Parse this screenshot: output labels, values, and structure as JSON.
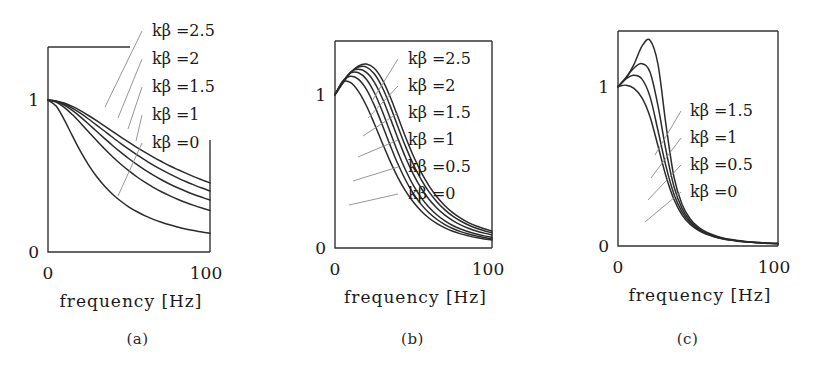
{
  "figure": {
    "axis_label": "frequency  [Hz]",
    "y_ticks": [
      "1",
      "0"
    ],
    "x_ticks": [
      "0",
      "100"
    ],
    "label_prefix": "kβ ="
  },
  "panels": [
    {
      "caption": "(a)",
      "labels": [
        "kβ =2.5",
        "kβ =2",
        "kβ =1.5",
        "kβ =1",
        "kβ =0"
      ]
    },
    {
      "caption": "(b)",
      "labels": [
        "kβ =2.5",
        "kβ =2",
        "kβ =1.5",
        "kβ =1",
        "kβ =0.5",
        "kβ =0"
      ]
    },
    {
      "caption": "(c)",
      "labels": [
        "kβ =1.5",
        "kβ =1",
        "kβ =0.5",
        "kβ =0"
      ]
    }
  ],
  "chart_data": [
    {
      "type": "line",
      "panel": "(a)",
      "title": "",
      "xlabel": "frequency  [Hz]",
      "ylabel": "",
      "xlim": [
        0,
        100
      ],
      "ylim": [
        0,
        1.35
      ],
      "xticks": [
        0,
        100
      ],
      "yticks": [
        0,
        1
      ],
      "grid": false,
      "legend": "inline-leader-lines",
      "x": [
        0,
        5,
        10,
        15,
        20,
        25,
        30,
        35,
        40,
        45,
        50,
        55,
        60,
        65,
        70,
        75,
        80,
        85,
        90,
        95,
        100
      ],
      "series": [
        {
          "name": "kβ =2.5",
          "kbeta": 2.5,
          "values": [
            1.0,
            0.995,
            0.981,
            0.959,
            0.931,
            0.899,
            0.865,
            0.829,
            0.793,
            0.757,
            0.722,
            0.688,
            0.656,
            0.625,
            0.596,
            0.568,
            0.543,
            0.519,
            0.496,
            0.475,
            0.455
          ]
        },
        {
          "name": "kβ =2",
          "kbeta": 2.0,
          "values": [
            1.0,
            0.993,
            0.975,
            0.948,
            0.914,
            0.876,
            0.836,
            0.795,
            0.754,
            0.714,
            0.676,
            0.639,
            0.605,
            0.572,
            0.542,
            0.514,
            0.488,
            0.464,
            0.442,
            0.421,
            0.402
          ]
        },
        {
          "name": "kβ =1.5",
          "kbeta": 1.5,
          "values": [
            1.0,
            0.991,
            0.967,
            0.932,
            0.89,
            0.843,
            0.795,
            0.747,
            0.7,
            0.656,
            0.614,
            0.575,
            0.539,
            0.506,
            0.476,
            0.448,
            0.423,
            0.4,
            0.379,
            0.36,
            0.342
          ]
        },
        {
          "name": "kβ =1",
          "kbeta": 1.0,
          "values": [
            1.0,
            0.987,
            0.953,
            0.905,
            0.85,
            0.792,
            0.734,
            0.678,
            0.626,
            0.578,
            0.534,
            0.494,
            0.458,
            0.426,
            0.397,
            0.371,
            0.347,
            0.326,
            0.307,
            0.29,
            0.274
          ]
        },
        {
          "name": "kβ =0",
          "kbeta": 0.0,
          "values": [
            1.0,
            0.961,
            0.872,
            0.766,
            0.664,
            0.574,
            0.497,
            0.433,
            0.379,
            0.334,
            0.296,
            0.265,
            0.238,
            0.215,
            0.196,
            0.179,
            0.165,
            0.152,
            0.141,
            0.131,
            0.123
          ]
        }
      ]
    },
    {
      "type": "line",
      "panel": "(b)",
      "title": "",
      "xlabel": "frequency  [Hz]",
      "ylabel": "",
      "xlim": [
        0,
        100
      ],
      "ylim": [
        0,
        1.35
      ],
      "xticks": [
        0,
        100
      ],
      "yticks": [
        0,
        1
      ],
      "grid": false,
      "legend": "inline-leader-lines",
      "x": [
        0,
        5,
        10,
        15,
        20,
        25,
        30,
        35,
        40,
        45,
        50,
        55,
        60,
        65,
        70,
        75,
        80,
        85,
        90,
        95,
        100
      ],
      "series": [
        {
          "name": "kβ =2.5",
          "kbeta": 2.5,
          "peak_value": 1.2,
          "peak_frequency": 20,
          "values": [
            1.0,
            1.075,
            1.145,
            1.188,
            1.2,
            1.172,
            1.1,
            0.99,
            0.857,
            0.722,
            0.598,
            0.492,
            0.404,
            0.333,
            0.276,
            0.231,
            0.195,
            0.166,
            0.143,
            0.125,
            0.11
          ]
        },
        {
          "name": "kβ =2",
          "kbeta": 2.0,
          "peak_value": 1.185,
          "peak_frequency": 17,
          "values": [
            1.0,
            1.078,
            1.145,
            1.18,
            1.18,
            1.136,
            1.05,
            0.93,
            0.793,
            0.661,
            0.543,
            0.444,
            0.364,
            0.3,
            0.249,
            0.208,
            0.176,
            0.15,
            0.129,
            0.113,
            0.099
          ]
        },
        {
          "name": "kβ =1.5",
          "kbeta": 1.5,
          "peak_value": 1.165,
          "peak_frequency": 15,
          "values": [
            1.0,
            1.082,
            1.148,
            1.165,
            1.145,
            1.082,
            0.98,
            0.852,
            0.716,
            0.589,
            0.479,
            0.388,
            0.316,
            0.259,
            0.214,
            0.179,
            0.151,
            0.129,
            0.111,
            0.097,
            0.085
          ]
        },
        {
          "name": "kβ =1",
          "kbeta": 1.0,
          "peak_value": 1.145,
          "peak_frequency": 13,
          "values": [
            1.0,
            1.086,
            1.142,
            1.143,
            1.1,
            1.014,
            0.895,
            0.76,
            0.626,
            0.507,
            0.407,
            0.327,
            0.264,
            0.215,
            0.177,
            0.147,
            0.124,
            0.106,
            0.091,
            0.079,
            0.07
          ]
        },
        {
          "name": "kβ =0.5",
          "kbeta": 0.5,
          "peak_value": 1.12,
          "peak_frequency": 11,
          "values": [
            1.0,
            1.09,
            1.12,
            1.1,
            1.035,
            0.932,
            0.806,
            0.674,
            0.549,
            0.442,
            0.353,
            0.283,
            0.228,
            0.186,
            0.153,
            0.127,
            0.107,
            0.091,
            0.079,
            0.068,
            0.06
          ]
        },
        {
          "name": "kβ =0",
          "kbeta": 0.0,
          "peak_value": 1.09,
          "peak_frequency": 8,
          "values": [
            1.0,
            1.082,
            1.078,
            1.02,
            0.928,
            0.812,
            0.688,
            0.568,
            0.461,
            0.371,
            0.298,
            0.24,
            0.194,
            0.159,
            0.131,
            0.109,
            0.092,
            0.079,
            0.068,
            0.059,
            0.052
          ]
        }
      ]
    },
    {
      "type": "line",
      "panel": "(c)",
      "title": "",
      "xlabel": "frequency  [Hz]",
      "ylabel": "",
      "xlim": [
        0,
        100
      ],
      "ylim": [
        0,
        1.35
      ],
      "xticks": [
        0,
        100
      ],
      "yticks": [
        0,
        1
      ],
      "grid": false,
      "legend": "inline-leader-lines",
      "x": [
        0,
        5,
        10,
        15,
        20,
        25,
        30,
        35,
        40,
        45,
        50,
        55,
        60,
        65,
        70,
        75,
        80,
        85,
        90,
        95,
        100
      ],
      "series": [
        {
          "name": "kβ =1.5",
          "kbeta": 1.5,
          "peak_value": 1.295,
          "peak_frequency": 17,
          "values": [
            1.0,
            1.055,
            1.14,
            1.255,
            1.292,
            1.14,
            0.76,
            0.432,
            0.262,
            0.172,
            0.12,
            0.088,
            0.067,
            0.052,
            0.042,
            0.034,
            0.029,
            0.024,
            0.021,
            0.018,
            0.016
          ]
        },
        {
          "name": "kβ =1",
          "kbeta": 1.0,
          "peak_value": 1.145,
          "peak_frequency": 14,
          "values": [
            1.0,
            1.058,
            1.118,
            1.145,
            1.092,
            0.88,
            0.6,
            0.372,
            0.236,
            0.159,
            0.113,
            0.083,
            0.063,
            0.049,
            0.039,
            0.032,
            0.027,
            0.023,
            0.02,
            0.017,
            0.015
          ]
        },
        {
          "name": "kβ =0.5",
          "kbeta": 0.5,
          "peak_value": 1.075,
          "peak_frequency": 11,
          "values": [
            1.0,
            1.05,
            1.072,
            1.048,
            0.938,
            0.725,
            0.5,
            0.325,
            0.214,
            0.147,
            0.106,
            0.079,
            0.06,
            0.047,
            0.038,
            0.031,
            0.026,
            0.022,
            0.019,
            0.017,
            0.015
          ]
        },
        {
          "name": "kβ =0",
          "kbeta": 0.0,
          "peak_value": 1.012,
          "peak_frequency": 6,
          "values": [
            1.0,
            1.01,
            0.99,
            0.93,
            0.812,
            0.628,
            0.438,
            0.292,
            0.196,
            0.137,
            0.1,
            0.075,
            0.058,
            0.046,
            0.037,
            0.03,
            0.025,
            0.022,
            0.019,
            0.016,
            0.014
          ]
        }
      ]
    }
  ]
}
